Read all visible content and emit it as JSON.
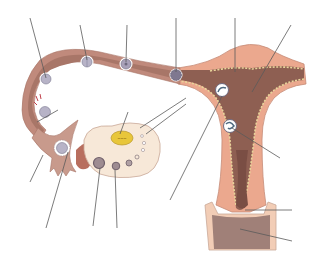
{
  "diagram": {
    "title": "",
    "labels_visible": false,
    "leader_line_count": 17,
    "colors": {
      "background": "#ffffff",
      "muscle_outer": "#eba88e",
      "muscle_light": "#f0b9a0",
      "lumen": "#8e5f52",
      "lumen_dark": "#7a4e44",
      "oviduct_wall": "#c08a7c",
      "oviduct_lumen": "#a87668",
      "endometrium_edge": "#e8d49a",
      "ovary": "#f7e8d8",
      "ovary_outline": "#c9a898",
      "corpus_luteum": "#e8c63a",
      "follicle": "#9e8c92",
      "follicle_dark": "#6f5f6a",
      "cell": "#b7b3c7",
      "cell_ring": "#ffffff",
      "vagina": "#a08078",
      "vagina_wall": "#f2cdb6",
      "leader_line": "#5a5a5a"
    },
    "structures": [
      {
        "id": "oviduct",
        "name": "Oviduct (fallopian tube)"
      },
      {
        "id": "uterus",
        "name": "Uterus"
      },
      {
        "id": "ovary",
        "name": "Ovary"
      },
      {
        "id": "corpus-luteum",
        "name": "Corpus luteum"
      },
      {
        "id": "fimbriae",
        "name": "Fimbriae"
      },
      {
        "id": "cervix",
        "name": "Cervix"
      },
      {
        "id": "vagina",
        "name": "Vagina"
      },
      {
        "id": "endometrium",
        "name": "Endometrium"
      }
    ],
    "cells": [
      {
        "id": "secondary-oocyte",
        "cx": 62,
        "cy": 148
      },
      {
        "id": "fertilization",
        "cx": 45,
        "cy": 112
      },
      {
        "id": "zygote",
        "cx": 46,
        "cy": 79
      },
      {
        "id": "two-cell",
        "cx": 87,
        "cy": 62
      },
      {
        "id": "four-cell",
        "cx": 126,
        "cy": 64
      },
      {
        "id": "morula",
        "cx": 176,
        "cy": 75
      },
      {
        "id": "blastocyst",
        "cx": 222,
        "cy": 90
      },
      {
        "id": "implanting-blastocyst",
        "cx": 230,
        "cy": 126
      }
    ]
  }
}
